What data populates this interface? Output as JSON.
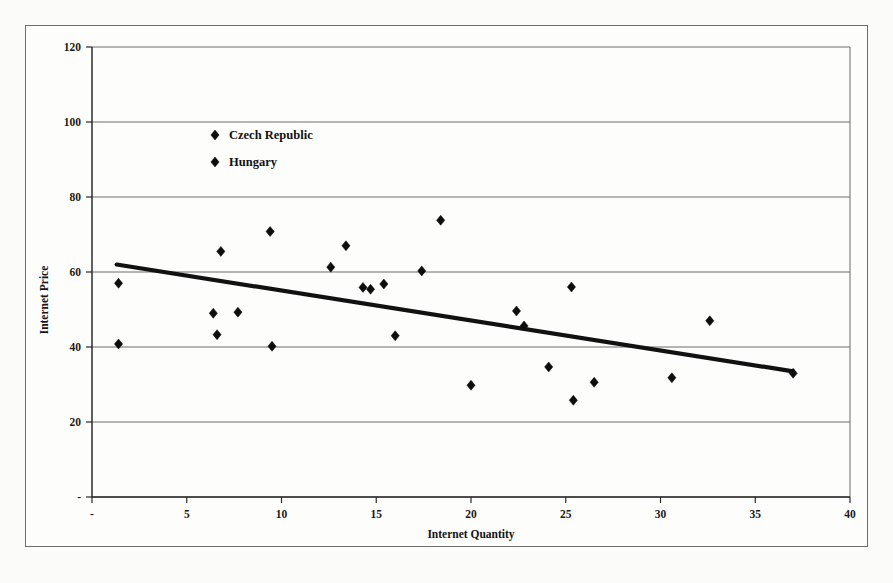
{
  "figure": {
    "background_color": "#fbfbfa",
    "frame_color": "#6d6d6d",
    "marker_color": "#0d0d0d",
    "trend_color": "#111111"
  },
  "legend": {
    "position": "inside-upper-left",
    "entries": [
      {
        "label": "Czech Republic",
        "marker": "diamond",
        "color": "#0d0d0d"
      },
      {
        "label": "Hungary",
        "marker": "diamond",
        "color": "#0d0d0d"
      }
    ]
  },
  "axes": {
    "x": {
      "title": "Internet Quantity",
      "tick_labels": [
        "-",
        "5",
        "10",
        "15",
        "20",
        "25",
        "30",
        "35",
        "40"
      ],
      "tick_values": [
        0,
        5,
        10,
        15,
        20,
        25,
        30,
        35,
        40
      ],
      "min": 0,
      "max": 40
    },
    "y": {
      "title": "Internet Price",
      "tick_labels": [
        "-",
        "20",
        "40",
        "60",
        "80",
        "100",
        "120"
      ],
      "tick_values": [
        0,
        20,
        40,
        60,
        80,
        100,
        120
      ],
      "min": 0,
      "max": 120
    }
  },
  "chart_data": {
    "type": "scatter",
    "title": "",
    "xlabel": "Internet Quantity",
    "ylabel": "Internet Price",
    "xlim": [
      0,
      40
    ],
    "ylim": [
      0,
      120
    ],
    "grid": "horizontal",
    "legend_position": "inside-upper-left",
    "series": [
      {
        "name": "Czech Republic",
        "marker": "diamond",
        "color": "#0d0d0d",
        "points": [
          {
            "x": 1.4,
            "y": 57.0
          },
          {
            "x": 1.4,
            "y": 40.8
          },
          {
            "x": 6.4,
            "y": 49.0
          },
          {
            "x": 6.6,
            "y": 43.3
          },
          {
            "x": 6.8,
            "y": 65.5
          },
          {
            "x": 7.7,
            "y": 49.3
          },
          {
            "x": 9.4,
            "y": 70.8
          },
          {
            "x": 9.5,
            "y": 40.2
          },
          {
            "x": 12.6,
            "y": 61.3
          },
          {
            "x": 13.4,
            "y": 67.0
          },
          {
            "x": 14.3,
            "y": 55.9
          },
          {
            "x": 14.7,
            "y": 55.4
          },
          {
            "x": 15.4,
            "y": 56.8
          },
          {
            "x": 16.0,
            "y": 43.0
          },
          {
            "x": 17.4,
            "y": 60.3
          },
          {
            "x": 18.4,
            "y": 73.8
          },
          {
            "x": 20.0,
            "y": 29.8
          },
          {
            "x": 22.4,
            "y": 49.6
          },
          {
            "x": 22.8,
            "y": 45.6
          },
          {
            "x": 24.1,
            "y": 34.7
          },
          {
            "x": 25.3,
            "y": 56.0
          },
          {
            "x": 25.4,
            "y": 25.8
          },
          {
            "x": 26.5,
            "y": 30.6
          },
          {
            "x": 30.6,
            "y": 31.8
          },
          {
            "x": 32.6,
            "y": 47.0
          },
          {
            "x": 37.0,
            "y": 33.0
          }
        ]
      }
    ],
    "trendline": {
      "type": "linear",
      "from": {
        "x": 1.3,
        "y": 62.0
      },
      "to": {
        "x": 37.0,
        "y": 33.5
      },
      "color": "#111111"
    }
  }
}
